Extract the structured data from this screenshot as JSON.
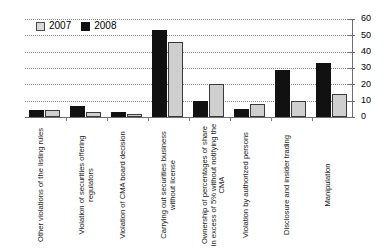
{
  "chart_data": {
    "type": "bar",
    "title": "",
    "subtitle": "",
    "xlabel": "",
    "ylabel": "",
    "ylim": [
      0,
      60
    ],
    "yticks": [
      0,
      10,
      20,
      30,
      40,
      50,
      60
    ],
    "grid": true,
    "legend_position": "top-left",
    "categories": [
      "Other violations of the listing rules",
      "Violation of securities offering regulators",
      "Violation of CMA board decision",
      "Carrying out securities business without license",
      "Ownership of percentages of share in excess of 5% without notifying the CMA",
      "Violation by authorized persons",
      "Disclosure and insider trading",
      "Manipulation"
    ],
    "series": [
      {
        "name": "2007",
        "color": "#cfcfcf",
        "values": [
          4,
          3,
          2,
          46,
          20,
          8,
          10,
          14
        ]
      },
      {
        "name": "2008",
        "color": "#111111",
        "values": [
          4,
          7,
          3,
          53,
          10,
          5,
          29,
          33
        ]
      }
    ]
  },
  "legend": {
    "items": [
      {
        "label": "2007",
        "swatch": "legend-swatch-2007"
      },
      {
        "label": "2008",
        "swatch": "legend-swatch-2008"
      }
    ]
  },
  "axis": {
    "y_tick_labels": [
      "0",
      "10",
      "20",
      "30",
      "40",
      "50",
      "60"
    ]
  }
}
